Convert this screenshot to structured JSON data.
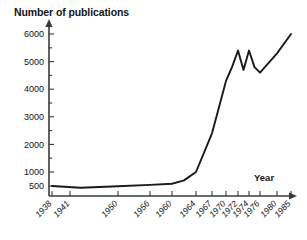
{
  "chart_data": {
    "type": "line",
    "title": "Number of publications",
    "xlabel": "Year",
    "ylabel": "Number of publications",
    "grid": false,
    "legend": null,
    "ytick_labels": [
      "500",
      "1000",
      "2000",
      "3000",
      "4000",
      "5000",
      "6000"
    ],
    "ytick_values": [
      500,
      1000,
      2000,
      3000,
      4000,
      5000,
      6000
    ],
    "ylim": [
      0,
      6200
    ],
    "xtick_labels": [
      "1938",
      "1941",
      "1950",
      "1956",
      "1960",
      "1964",
      "1967",
      "1970",
      "1972",
      "1974",
      "1976",
      "1980",
      "1985"
    ],
    "xtick_values": [
      1938,
      1941,
      1950,
      1956,
      1960,
      1964,
      1967,
      1970,
      1972,
      1974,
      1976,
      1980,
      1985
    ],
    "xlim": [
      1938,
      1987
    ],
    "x": [
      1938,
      1943,
      1950,
      1956,
      1960,
      1962,
      1964,
      1967,
      1970,
      1971,
      1972,
      1973,
      1974,
      1975,
      1976,
      1980,
      1985
    ],
    "values": [
      500,
      440,
      490,
      540,
      580,
      700,
      1000,
      2400,
      4300,
      4800,
      5400,
      4700,
      5400,
      4800,
      4600,
      5300,
      6000
    ],
    "series": [
      {
        "name": "Number of publications",
        "values": [
          500,
          440,
          490,
          540,
          580,
          700,
          1000,
          2400,
          4300,
          4800,
          5400,
          4700,
          5400,
          4800,
          4600,
          5300,
          6000
        ]
      }
    ],
    "annotations": [
      {
        "text": "Number of publications",
        "position": "top-left"
      },
      {
        "text": "Year",
        "position": "right-of-x-axis"
      }
    ]
  },
  "axis": {
    "year_label": "Year",
    "title": "Number of publications"
  },
  "colors": {
    "line": "#1a1a1a",
    "axis": "#3a3a3a",
    "text": "#141414",
    "background": "#ffffff"
  }
}
